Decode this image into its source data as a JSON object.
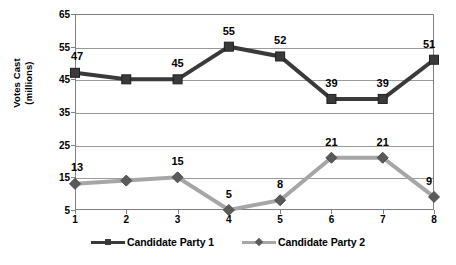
{
  "chart_data": {
    "type": "line",
    "title": "",
    "xlabel": "",
    "ylabel": "Votes Cast (millions)",
    "ylabel_lines": [
      "Votes Cast",
      "(millions)"
    ],
    "x": [
      1,
      2,
      3,
      4,
      5,
      6,
      7,
      8
    ],
    "xticklabels": [
      "1",
      "2",
      "3",
      "4",
      "5",
      "6",
      "7",
      "8"
    ],
    "yticklabels": [
      "65",
      "55",
      "45",
      "35",
      "25",
      "15",
      "5"
    ],
    "yticks": [
      65,
      55,
      45,
      35,
      25,
      15,
      5
    ],
    "ylim": [
      5,
      65
    ],
    "xlim": [
      1,
      8
    ],
    "grid": "horizontal",
    "legend_position": "bottom-center",
    "series": [
      {
        "name": "Candidate Party 1",
        "color": "#3a3a3a",
        "marker": "square",
        "values": [
          47,
          45,
          45,
          55,
          52,
          39,
          39,
          51
        ],
        "labels": [
          "47",
          "",
          "45",
          "55",
          "52",
          "39",
          "39",
          "51"
        ],
        "label_shown": [
          true,
          false,
          true,
          true,
          true,
          true,
          true,
          true
        ]
      },
      {
        "name": "Candidate Party 2",
        "color": "#a6a6a6",
        "marker": "diamond",
        "values": [
          13,
          14,
          15,
          5,
          8,
          21,
          21,
          9
        ],
        "labels": [
          "13",
          "",
          "15",
          "5",
          "8",
          "21",
          "21",
          "9"
        ],
        "label_shown": [
          true,
          false,
          true,
          true,
          true,
          true,
          true,
          true
        ]
      }
    ]
  },
  "legend": {
    "items": [
      {
        "label": "Candidate Party 1"
      },
      {
        "label": "Candidate Party 2"
      }
    ]
  },
  "colors": {
    "series1": "#3a3a3a",
    "series2": "#a6a6a6",
    "marker2": "#5a5a5a",
    "grid": "#9a9a9a",
    "axis": "#808080",
    "text": "#000000",
    "background": "#ffffff"
  }
}
